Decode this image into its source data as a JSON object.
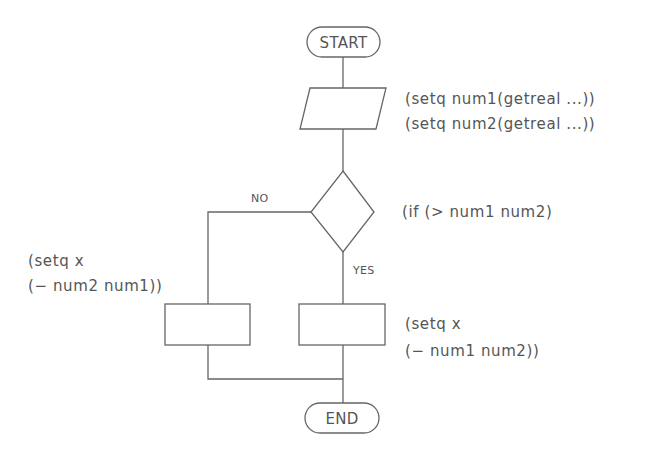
{
  "diagram": {
    "type": "flowchart",
    "colors": {
      "stroke": "#666666",
      "text": "#555555",
      "background": "#ffffff"
    },
    "nodes": {
      "start": {
        "label": "START",
        "shape": "terminal"
      },
      "input": {
        "shape": "parallelogram",
        "annotation": [
          "(setq  num1(getreal  ...))",
          "(setq  num2(getreal  ...))"
        ]
      },
      "decision": {
        "shape": "diamond",
        "annotation": "(if  (>  num1  num2)"
      },
      "no_process": {
        "shape": "rectangle",
        "annotation": [
          "(setq  x",
          "(−  num2  num1))"
        ]
      },
      "yes_process": {
        "shape": "rectangle",
        "annotation": [
          "(setq  x",
          "(−  num1  num2))"
        ]
      },
      "end": {
        "label": "END",
        "shape": "terminal"
      }
    },
    "edges": {
      "no_label": "NO",
      "yes_label": "YES"
    }
  }
}
